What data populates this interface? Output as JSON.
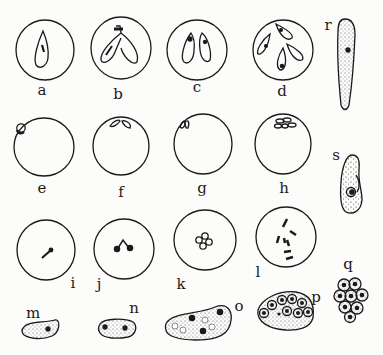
{
  "figure": {
    "panels": [
      {
        "id": "a",
        "label": "a",
        "kind": "cell",
        "content": "single pear-shaped parasite"
      },
      {
        "id": "b",
        "label": "b",
        "kind": "cell",
        "content": "two joined pear-shaped parasites (dividing)"
      },
      {
        "id": "c",
        "label": "c",
        "kind": "cell",
        "content": "paired pear-shaped parasites"
      },
      {
        "id": "d",
        "label": "d",
        "kind": "cell",
        "content": "four pear-shaped parasites"
      },
      {
        "id": "e",
        "label": "e",
        "kind": "cell",
        "content": "small round parasite at margin"
      },
      {
        "id": "f",
        "label": "f",
        "kind": "cell",
        "content": "paired parasites at margin"
      },
      {
        "id": "g",
        "label": "g",
        "kind": "cell",
        "content": "paired parasites at edge"
      },
      {
        "id": "h",
        "label": "h",
        "kind": "cell",
        "content": "cluster of parasites at margin"
      },
      {
        "id": "i",
        "label": "i",
        "kind": "cell",
        "content": "rod-shaped parasite"
      },
      {
        "id": "j",
        "label": "j",
        "kind": "cell",
        "content": "forked parasite with two nuclei"
      },
      {
        "id": "k",
        "label": "k",
        "kind": "cell",
        "content": "small cluster of four"
      },
      {
        "id": "l",
        "label": "l",
        "kind": "cell",
        "content": "scattered rod-shaped bodies"
      },
      {
        "id": "m",
        "label": "m",
        "kind": "free",
        "content": "uninucleate amoeboid form"
      },
      {
        "id": "n",
        "label": "n",
        "kind": "free",
        "content": "binucleate form"
      },
      {
        "id": "o",
        "label": "o",
        "kind": "free",
        "content": "multinucleate vacuolated form"
      },
      {
        "id": "p",
        "label": "p",
        "kind": "free",
        "content": "segmenting schizont"
      },
      {
        "id": "q",
        "label": "q",
        "kind": "free",
        "content": "cluster of merozoites"
      },
      {
        "id": "r",
        "label": "r",
        "kind": "free",
        "content": "elongated spindle form"
      },
      {
        "id": "s",
        "label": "s",
        "kind": "free",
        "content": "oval granular form with nucleus"
      }
    ]
  }
}
